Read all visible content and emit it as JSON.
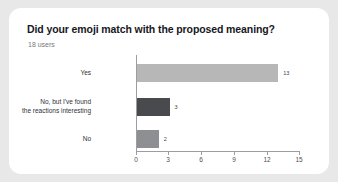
{
  "card": {
    "background": "#ffffff",
    "page_background": "#e8e8e8"
  },
  "header": {
    "title": "Did your emoji match with the proposed meaning?",
    "subtitle": "18 users"
  },
  "chart_data": {
    "type": "bar",
    "orientation": "horizontal",
    "title": "Did your emoji match with the proposed meaning?",
    "subtitle": "18 users",
    "xlabel": "",
    "ylabel": "",
    "xlim": [
      0,
      15
    ],
    "grid": false,
    "legend": false,
    "categories": [
      "Yes",
      "No, but I've found\nthe reactions interesting",
      "No"
    ],
    "values": [
      13,
      3,
      2
    ],
    "value_labels": [
      "13",
      "3",
      "2"
    ],
    "colors": [
      "#b7b7b7",
      "#484a4d",
      "#8d8f92"
    ],
    "xticks": [
      0,
      3,
      6,
      9,
      12,
      15
    ],
    "xtick_labels": [
      "0",
      "3",
      "6",
      "9",
      "12",
      "15"
    ],
    "axis_color": "#9b9da1"
  }
}
